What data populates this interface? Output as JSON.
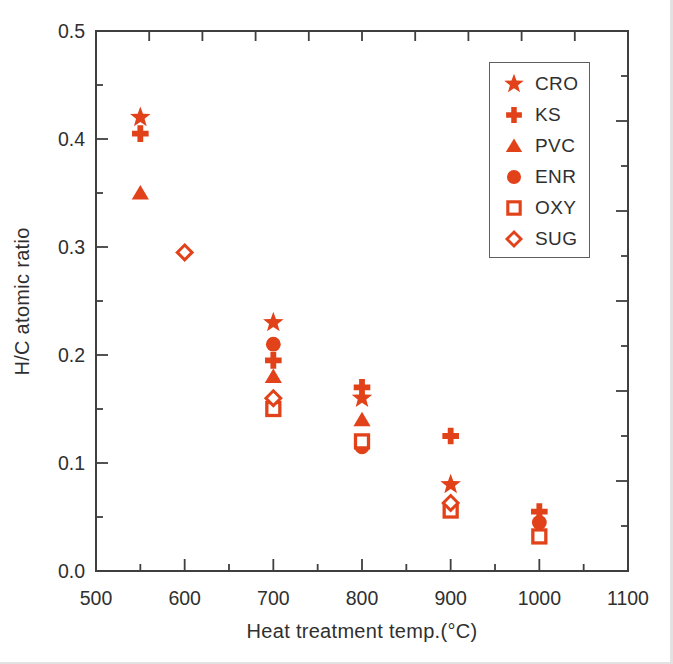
{
  "figure": {
    "marker_color": "#e2421a",
    "axis_color": "#3f3f3f",
    "text_color": "#2f2f2f",
    "background": "#ffffff"
  },
  "chart_data": {
    "type": "scatter",
    "title": "",
    "xlabel": "Heat treatment temp.(°C)",
    "ylabel": "H/C atomic ratio",
    "xlim": [
      500,
      1100
    ],
    "ylim": [
      0.0,
      0.5
    ],
    "grid": false,
    "legend_position": "upper-right",
    "x_tick_labels": [
      {
        "v": 500,
        "t": "500"
      },
      {
        "v": 600,
        "t": "600"
      },
      {
        "v": 700,
        "t": "700"
      },
      {
        "v": 800,
        "t": "800"
      },
      {
        "v": 900,
        "t": "900"
      },
      {
        "v": 1000,
        "t": "1000"
      },
      {
        "v": 1100,
        "t": "1100"
      }
    ],
    "x_major_ticks": [
      600,
      700,
      800,
      900,
      1000
    ],
    "x_minor_ticks": [
      550,
      650,
      750,
      850,
      950,
      1050
    ],
    "y_tick_labels": [
      {
        "v": 0.5,
        "t": "0.5"
      },
      {
        "v": 0.4,
        "t": "0.4"
      },
      {
        "v": 0.3,
        "t": "0.3"
      },
      {
        "v": 0.2,
        "t": "0.2"
      },
      {
        "v": 0.1,
        "t": "0.1"
      },
      {
        "v": 0.0,
        "t": "0.0"
      }
    ],
    "y_major_ticks": [
      0.1,
      0.2,
      0.3,
      0.4
    ],
    "y_minor_ticks": [
      0.05,
      0.15,
      0.25,
      0.35,
      0.45
    ],
    "top_edge_tick_count": 9,
    "right_edge_tick_count": 11,
    "series": [
      {
        "name": "CRO",
        "marker": "star",
        "fill": "solid",
        "points": [
          [
            550,
            0.42
          ],
          [
            700,
            0.23
          ],
          [
            800,
            0.16
          ],
          [
            900,
            0.08
          ]
        ]
      },
      {
        "name": "KS",
        "marker": "plus",
        "fill": "solid",
        "points": [
          [
            550,
            0.405
          ],
          [
            700,
            0.195
          ],
          [
            800,
            0.17
          ],
          [
            900,
            0.125
          ],
          [
            1000,
            0.055
          ]
        ]
      },
      {
        "name": "PVC",
        "marker": "triangle",
        "fill": "solid",
        "points": [
          [
            550,
            0.35
          ],
          [
            700,
            0.18
          ],
          [
            800,
            0.14
          ]
        ]
      },
      {
        "name": "ENR",
        "marker": "circle",
        "fill": "solid",
        "points": [
          [
            700,
            0.21
          ],
          [
            800,
            0.115
          ],
          [
            1000,
            0.045
          ]
        ]
      },
      {
        "name": "OXY",
        "marker": "square",
        "fill": "open",
        "points": [
          [
            700,
            0.15
          ],
          [
            800,
            0.12
          ],
          [
            900,
            0.056
          ],
          [
            1000,
            0.032
          ]
        ]
      },
      {
        "name": "SUG",
        "marker": "diamond",
        "fill": "open",
        "points": [
          [
            600,
            0.295
          ],
          [
            700,
            0.16
          ],
          [
            900,
            0.063
          ]
        ]
      }
    ]
  }
}
